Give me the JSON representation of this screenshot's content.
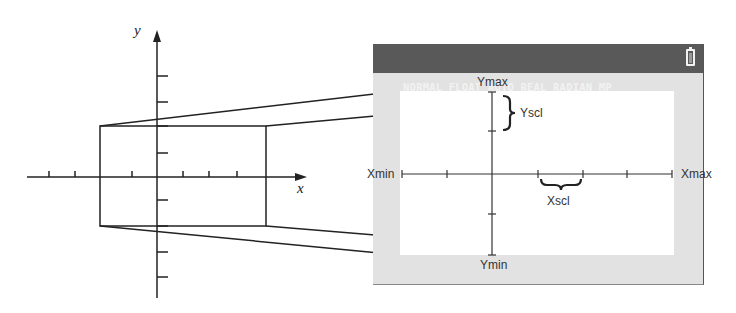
{
  "diagram": {
    "left_plane": {
      "x_axis_label": "x",
      "y_axis_label": "y"
    },
    "calculator_screen": {
      "status_bar": {
        "text": "NORMAL FLOAT AUTO REAL RADIAN MP",
        "icon": "battery-icon"
      },
      "labels": {
        "ymax": "Ymax",
        "ymin": "Ymin",
        "xmin": "Xmin",
        "xmax": "Xmax",
        "yscl": "Yscl",
        "xscl": "Xscl"
      }
    },
    "colors": {
      "line": "#222222",
      "status_bar_bg": "#595959",
      "screen_border_bg": "#e2e2e2",
      "plot_bg": "#ffffff"
    }
  }
}
